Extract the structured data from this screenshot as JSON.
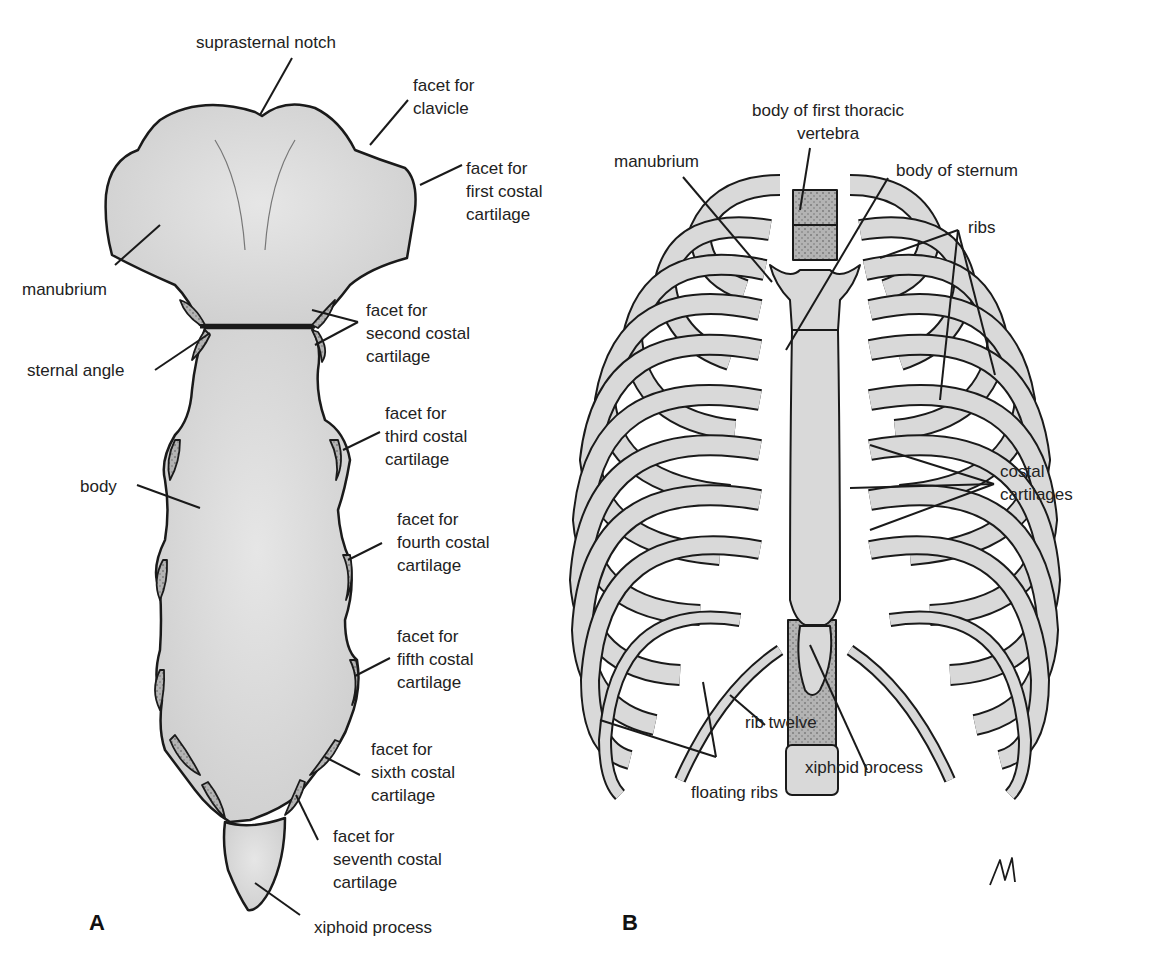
{
  "figure": {
    "panels": [
      {
        "id": "A",
        "letter": "A",
        "subject": "sternum (anterior view)",
        "labels": {
          "suprasternal_notch": "suprasternal notch",
          "facet_clavicle": "facet for\nclavicle",
          "facet_first": "facet for\nfirst costal\ncartilage",
          "manubrium": "manubrium",
          "facet_second": "facet for\nsecond costal\ncartilage",
          "sternal_angle": "sternal angle",
          "facet_third": "facet for\nthird costal\ncartilage",
          "body": "body",
          "facet_fourth": "facet for\nfourth costal\ncartilage",
          "facet_fifth": "facet for\nfifth costal\ncartilage",
          "facet_sixth": "facet for\nsixth costal\ncartilage",
          "facet_seventh": "facet for\nseventh costal\ncartilage",
          "xiphoid": "xiphoid process"
        }
      },
      {
        "id": "B",
        "letter": "B",
        "subject": "thoracic cage (anterior view)",
        "labels": {
          "vertebra": "body of first thoracic\nvertebra",
          "manubrium": "manubrium",
          "body_sternum": "body of sternum",
          "ribs": "ribs",
          "costal_cartilages": "costal\ncartilages",
          "rib_twelve": "rib twelve",
          "xiphoid": "xiphoid process",
          "floating_ribs": "floating ribs"
        }
      }
    ],
    "colors": {
      "bone_fill": "#d9d9d9",
      "cartilage_fill": "#b8b8b8",
      "outline": "#1a1a1a",
      "background": "#ffffff"
    }
  }
}
